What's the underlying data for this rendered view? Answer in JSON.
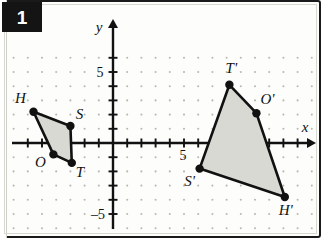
{
  "problem": {
    "number": "1"
  },
  "graph": {
    "axis_labels": {
      "x": "x",
      "y": "y"
    },
    "tick_labels": {
      "y_positive": "5",
      "y_negative": "–5",
      "x_positive": "5"
    },
    "origin_px": {
      "x": 111,
      "y": 141
    },
    "unit_px": 14.2,
    "x_range": [
      -7.6,
      14.2
    ],
    "y_range": [
      -6.6,
      6.6
    ],
    "grid": {
      "visible": true,
      "style": "dots",
      "color": "#b9b9b4"
    },
    "axis_color": "#111111",
    "shape_fill": "#d9d9d4",
    "shape_stroke": "#111111",
    "vertex_color": "#111111"
  },
  "chart_data": {
    "type": "scatter",
    "title": "",
    "xlabel": "x",
    "ylabel": "y",
    "xlim": [
      -7.6,
      14.2
    ],
    "ylim": [
      -6.6,
      6.6
    ],
    "grid": true,
    "legend": "none",
    "series": [
      {
        "name": "Preimage HSTO",
        "closed": true,
        "points": [
          {
            "label": "H",
            "x": -5.6,
            "y": 2.2,
            "label_dx": -13,
            "label_dy": -9
          },
          {
            "label": "S",
            "x": -3.0,
            "y": 1.2,
            "label_dx": 9,
            "label_dy": -7
          },
          {
            "label": "T",
            "x": -2.9,
            "y": -1.4,
            "label_dx": 8,
            "label_dy": 14
          },
          {
            "label": "O",
            "x": -4.2,
            "y": -0.8,
            "label_dx": -13,
            "label_dy": 13
          }
        ]
      },
      {
        "name": "Image T'O'H'S'",
        "closed": true,
        "points": [
          {
            "label": "T'",
            "x": 8.2,
            "y": 4.1,
            "label_dx": 2,
            "label_dy": -12
          },
          {
            "label": "O'",
            "x": 10.1,
            "y": 2.1,
            "label_dx": 11,
            "label_dy": -9
          },
          {
            "label": "H'",
            "x": 12.1,
            "y": -3.8,
            "label_dx": 1,
            "label_dy": 18
          },
          {
            "label": "S'",
            "x": 6.1,
            "y": -1.8,
            "label_dx": -10,
            "label_dy": 17
          }
        ]
      }
    ]
  }
}
